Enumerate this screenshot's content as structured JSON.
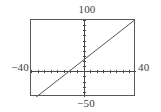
{
  "figure": {
    "name": "graphing-calculator-window",
    "background_color": "#ffffff",
    "frame_color": "#595959",
    "axis_color": "#4a4a4a",
    "curve_color": "#555555"
  },
  "labels": {
    "y_max": "100",
    "y_min": "−50",
    "x_min": "−40",
    "x_max": "40"
  },
  "chart_data": {
    "type": "line",
    "title": "",
    "xlabel": "",
    "ylabel": "",
    "xlim": [
      -40,
      40
    ],
    "ylim": [
      -50,
      100
    ],
    "grid": false,
    "legend": null,
    "axes": {
      "x_axis_at_y": 0,
      "y_axis_at_x": 0,
      "x_tick_interval": 5,
      "y_tick_interval": 10,
      "ticks_on_axes": true,
      "tick_labels_shown": false
    },
    "series": [
      {
        "name": "line",
        "slope": 2.0,
        "intercept": 22,
        "x": [
          -37,
          40
        ],
        "y": [
          -52,
          102
        ],
        "x_intercept": -11,
        "y_intercept": 22
      }
    ]
  }
}
